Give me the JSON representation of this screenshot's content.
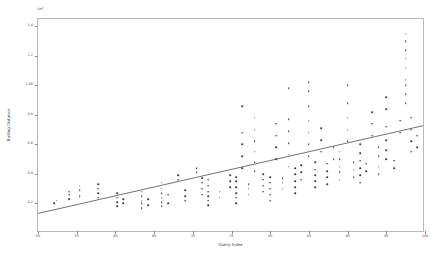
{
  "chart_data": {
    "type": "scatter",
    "title": "",
    "xlabel": "Query Index",
    "ylabel": "Trailing Distance",
    "y_offset_text": "1e7",
    "xlim": [
      50,
      100
    ],
    "ylim": [
      0.0,
      1.45
    ],
    "xticks": [
      50,
      55,
      60,
      65,
      70,
      75,
      80,
      85,
      90,
      95,
      100
    ],
    "xticklabels": [
      "50",
      "55",
      "60",
      "65",
      "70",
      "75",
      "80",
      "85",
      "90",
      "95",
      "100"
    ],
    "yticks": [
      0.2,
      0.4,
      0.6,
      0.8,
      1.0,
      1.2,
      1.4
    ],
    "yticklabels": [
      "0.2",
      "0.4",
      "0.6",
      "0.8",
      "1.00",
      "1.2",
      "1.4"
    ],
    "grid": false,
    "legend": null,
    "marker_color": "#39394a",
    "trendline_color": "#4a4a5a",
    "trendline": {
      "x0": 50,
      "y0": 0.12,
      "x1": 100,
      "y1": 0.72
    },
    "points": [
      [
        52.1,
        0.2
      ],
      [
        52.4,
        0.22
      ],
      [
        54.0,
        0.23
      ],
      [
        54.0,
        0.26
      ],
      [
        54.0,
        0.28
      ],
      [
        55.4,
        0.25
      ],
      [
        55.4,
        0.29
      ],
      [
        55.4,
        0.32
      ],
      [
        57.8,
        0.24
      ],
      [
        57.8,
        0.27
      ],
      [
        57.8,
        0.3
      ],
      [
        57.8,
        0.33
      ],
      [
        60.2,
        0.18
      ],
      [
        60.2,
        0.21
      ],
      [
        60.2,
        0.24
      ],
      [
        60.2,
        0.27
      ],
      [
        61.0,
        0.2
      ],
      [
        61.0,
        0.23
      ],
      [
        63.4,
        0.17
      ],
      [
        63.4,
        0.2
      ],
      [
        63.4,
        0.22
      ],
      [
        63.4,
        0.25
      ],
      [
        63.4,
        0.28
      ],
      [
        64.2,
        0.19
      ],
      [
        64.2,
        0.23
      ],
      [
        66.0,
        0.18
      ],
      [
        66.0,
        0.21
      ],
      [
        66.0,
        0.24
      ],
      [
        66.0,
        0.27
      ],
      [
        66.0,
        0.3
      ],
      [
        66.0,
        0.34
      ],
      [
        66.8,
        0.2
      ],
      [
        66.8,
        0.26
      ],
      [
        68.1,
        0.36
      ],
      [
        68.1,
        0.39
      ],
      [
        69.0,
        0.22
      ],
      [
        69.0,
        0.25
      ],
      [
        69.0,
        0.29
      ],
      [
        70.5,
        0.41
      ],
      [
        70.5,
        0.44
      ],
      [
        71.2,
        0.26
      ],
      [
        71.2,
        0.3
      ],
      [
        71.2,
        0.34
      ],
      [
        71.2,
        0.37
      ],
      [
        72.0,
        0.19
      ],
      [
        72.0,
        0.22
      ],
      [
        72.0,
        0.25
      ],
      [
        72.0,
        0.28
      ],
      [
        72.0,
        0.32
      ],
      [
        72.0,
        0.36
      ],
      [
        73.5,
        0.24
      ],
      [
        73.5,
        0.28
      ],
      [
        74.8,
        0.31
      ],
      [
        74.8,
        0.35
      ],
      [
        74.8,
        0.39
      ],
      [
        75.6,
        0.2
      ],
      [
        75.6,
        0.24
      ],
      [
        75.6,
        0.27
      ],
      [
        75.6,
        0.31
      ],
      [
        75.6,
        0.35
      ],
      [
        75.6,
        0.38
      ],
      [
        76.4,
        0.44
      ],
      [
        76.4,
        0.52
      ],
      [
        76.4,
        0.6
      ],
      [
        76.4,
        0.68
      ],
      [
        76.4,
        0.86
      ],
      [
        77.2,
        0.26
      ],
      [
        77.2,
        0.3
      ],
      [
        77.2,
        0.33
      ],
      [
        78.0,
        0.42
      ],
      [
        78.0,
        0.48
      ],
      [
        78.0,
        0.55
      ],
      [
        78.0,
        0.62
      ],
      [
        78.0,
        0.7
      ],
      [
        78.0,
        0.78
      ],
      [
        79.1,
        0.28
      ],
      [
        79.1,
        0.32
      ],
      [
        79.1,
        0.36
      ],
      [
        79.1,
        0.4
      ],
      [
        80.0,
        0.22
      ],
      [
        80.0,
        0.26
      ],
      [
        80.0,
        0.3
      ],
      [
        80.0,
        0.34
      ],
      [
        80.0,
        0.38
      ],
      [
        80.8,
        0.5
      ],
      [
        80.8,
        0.58
      ],
      [
        80.8,
        0.66
      ],
      [
        80.8,
        0.74
      ],
      [
        81.6,
        0.3
      ],
      [
        81.6,
        0.34
      ],
      [
        81.6,
        0.37
      ],
      [
        82.4,
        0.45
      ],
      [
        82.4,
        0.53
      ],
      [
        82.4,
        0.61
      ],
      [
        82.4,
        0.69
      ],
      [
        82.4,
        0.77
      ],
      [
        82.4,
        0.98
      ],
      [
        83.2,
        0.27
      ],
      [
        83.2,
        0.31
      ],
      [
        83.2,
        0.35
      ],
      [
        83.2,
        0.4
      ],
      [
        83.2,
        0.44
      ],
      [
        84.0,
        0.36
      ],
      [
        84.0,
        0.41
      ],
      [
        84.0,
        0.46
      ],
      [
        85.0,
        0.52
      ],
      [
        85.0,
        0.6
      ],
      [
        85.0,
        0.68
      ],
      [
        85.0,
        0.76
      ],
      [
        85.0,
        0.86
      ],
      [
        85.0,
        0.96
      ],
      [
        85.0,
        1.02
      ],
      [
        85.8,
        0.31
      ],
      [
        85.8,
        0.35
      ],
      [
        85.8,
        0.39
      ],
      [
        85.8,
        0.43
      ],
      [
        85.8,
        0.48
      ],
      [
        86.6,
        0.55
      ],
      [
        86.6,
        0.63
      ],
      [
        86.6,
        0.71
      ],
      [
        87.4,
        0.33
      ],
      [
        87.4,
        0.38
      ],
      [
        87.4,
        0.42
      ],
      [
        87.4,
        0.47
      ],
      [
        88.2,
        0.5
      ],
      [
        88.2,
        0.58
      ],
      [
        89.0,
        0.36
      ],
      [
        89.0,
        0.41
      ],
      [
        89.0,
        0.45
      ],
      [
        89.0,
        0.5
      ],
      [
        89.0,
        0.55
      ],
      [
        90.0,
        0.62
      ],
      [
        90.0,
        0.7
      ],
      [
        90.0,
        0.78
      ],
      [
        90.0,
        0.88
      ],
      [
        90.0,
        1.0
      ],
      [
        90.8,
        0.38
      ],
      [
        90.8,
        0.43
      ],
      [
        90.8,
        0.48
      ],
      [
        91.6,
        0.34
      ],
      [
        91.6,
        0.39
      ],
      [
        91.6,
        0.44
      ],
      [
        91.6,
        0.49
      ],
      [
        91.6,
        0.54
      ],
      [
        91.6,
        0.6
      ],
      [
        92.4,
        0.42
      ],
      [
        92.4,
        0.47
      ],
      [
        93.2,
        0.66
      ],
      [
        93.2,
        0.74
      ],
      [
        93.2,
        0.82
      ],
      [
        94.0,
        0.4
      ],
      [
        94.0,
        0.45
      ],
      [
        94.0,
        0.52
      ],
      [
        94.0,
        0.58
      ],
      [
        95.0,
        0.5
      ],
      [
        95.0,
        0.56
      ],
      [
        95.0,
        0.63
      ],
      [
        95.0,
        0.72
      ],
      [
        95.0,
        0.84
      ],
      [
        95.0,
        0.92
      ],
      [
        96.0,
        0.44
      ],
      [
        96.0,
        0.49
      ],
      [
        96.8,
        0.68
      ],
      [
        96.8,
        0.76
      ],
      [
        97.5,
        1.12
      ],
      [
        97.5,
        1.18
      ],
      [
        97.5,
        1.24
      ],
      [
        97.5,
        1.3
      ],
      [
        97.5,
        1.35
      ],
      [
        97.5,
        0.88
      ],
      [
        97.5,
        0.94
      ],
      [
        97.5,
        1.0
      ],
      [
        97.5,
        1.04
      ],
      [
        98.2,
        0.55
      ],
      [
        98.2,
        0.62
      ],
      [
        98.2,
        0.7
      ],
      [
        98.2,
        0.78
      ],
      [
        99.0,
        0.58
      ],
      [
        99.0,
        0.66
      ]
    ]
  }
}
